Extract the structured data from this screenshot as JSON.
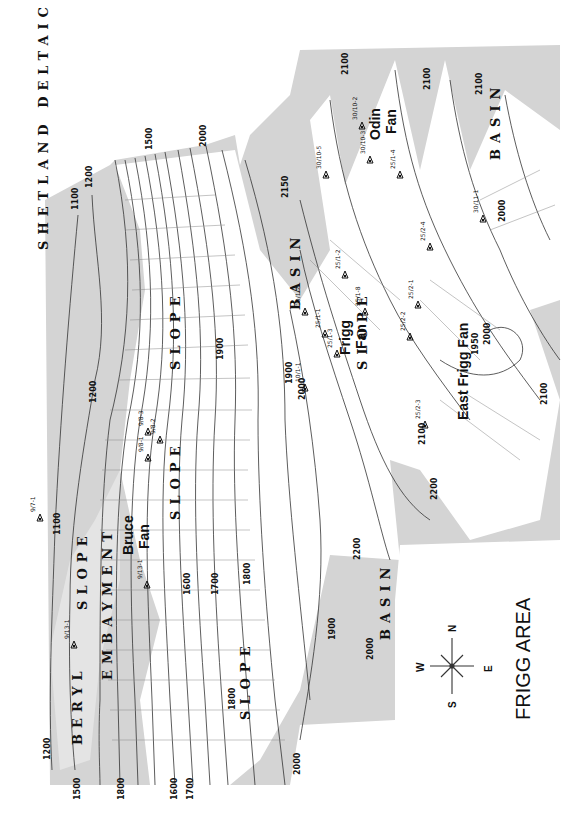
{
  "title": "FRIGG AREA",
  "compass": {
    "n": "N",
    "s": "S",
    "e": "E",
    "w": "W"
  },
  "colors": {
    "basin_shade": "#cfcfcf",
    "platform_shade": "#d6d6d6",
    "slope_white": "#ffffff",
    "contour": "#333333"
  },
  "regions": [
    {
      "id": "shetland",
      "label": "SHETLAND DELTAIC PLATFORM",
      "x": 48,
      "y": 250,
      "rotate": -90
    },
    {
      "id": "beryl",
      "label": "BERYL",
      "x": 82,
      "y": 745,
      "rotate": -90
    },
    {
      "id": "embayment",
      "label": "EMBAYMENT",
      "x": 112,
      "y": 680,
      "rotate": -90
    },
    {
      "id": "slope1",
      "label": "SLOPE",
      "x": 87,
      "y": 610,
      "rotate": -90
    },
    {
      "id": "slope2",
      "label": "SLOPE",
      "x": 180,
      "y": 370,
      "rotate": -90
    },
    {
      "id": "slope3",
      "label": "SLOPE",
      "x": 180,
      "y": 520,
      "rotate": -90
    },
    {
      "id": "slope4",
      "label": "SLOPE",
      "x": 250,
      "y": 720,
      "rotate": -90
    },
    {
      "id": "slope5",
      "label": "SLOPE",
      "x": 367,
      "y": 370,
      "rotate": -90
    },
    {
      "id": "basin1",
      "label": "BASIN",
      "x": 300,
      "y": 310,
      "rotate": -90
    },
    {
      "id": "basin2",
      "label": "BASIN",
      "x": 390,
      "y": 640,
      "rotate": -90
    },
    {
      "id": "basin3",
      "label": "BASIN",
      "x": 500,
      "y": 160,
      "rotate": -90
    }
  ],
  "fans": [
    {
      "id": "bruce",
      "label1": "Bruce",
      "label2": "Fan",
      "x": 133,
      "y": 555
    },
    {
      "id": "frigg",
      "label1": "Frigg",
      "label2": "Fan",
      "x": 350,
      "y": 355
    },
    {
      "id": "odin",
      "label1": "Odin",
      "label2": "Fan",
      "x": 380,
      "y": 140
    },
    {
      "id": "east_frigg",
      "label1": "East Frigg Fan",
      "label2": "",
      "x": 468,
      "y": 420
    }
  ],
  "contour_labels": [
    {
      "text": "1500",
      "x": 152,
      "y": 150
    },
    {
      "text": "2000",
      "x": 206,
      "y": 147
    },
    {
      "text": "1100",
      "x": 78,
      "y": 210
    },
    {
      "text": "1200",
      "x": 92,
      "y": 188
    },
    {
      "text": "2150",
      "x": 288,
      "y": 198
    },
    {
      "text": "2100",
      "x": 348,
      "y": 75
    },
    {
      "text": "2100",
      "x": 430,
      "y": 90
    },
    {
      "text": "2100",
      "x": 482,
      "y": 95
    },
    {
      "text": "2000",
      "x": 505,
      "y": 222
    },
    {
      "text": "1200",
      "x": 96,
      "y": 403
    },
    {
      "text": "1900",
      "x": 223,
      "y": 360
    },
    {
      "text": "1100",
      "x": 60,
      "y": 535
    },
    {
      "text": "1600",
      "x": 190,
      "y": 595
    },
    {
      "text": "1700",
      "x": 218,
      "y": 595
    },
    {
      "text": "1800",
      "x": 250,
      "y": 585
    },
    {
      "text": "1800",
      "x": 235,
      "y": 710
    },
    {
      "text": "1900",
      "x": 292,
      "y": 384
    },
    {
      "text": "2000",
      "x": 305,
      "y": 400
    },
    {
      "text": "1950",
      "x": 478,
      "y": 355
    },
    {
      "text": "2000",
      "x": 490,
      "y": 345
    },
    {
      "text": "2100",
      "x": 547,
      "y": 405
    },
    {
      "text": "2100",
      "x": 425,
      "y": 445
    },
    {
      "text": "2200",
      "x": 437,
      "y": 500
    },
    {
      "text": "2200",
      "x": 360,
      "y": 560
    },
    {
      "text": "1900",
      "x": 335,
      "y": 640
    },
    {
      "text": "2000",
      "x": 373,
      "y": 660
    },
    {
      "text": "2000",
      "x": 300,
      "y": 775
    },
    {
      "text": "1200",
      "x": 50,
      "y": 760
    },
    {
      "text": "1500",
      "x": 80,
      "y": 800
    },
    {
      "text": "1800",
      "x": 124,
      "y": 800
    },
    {
      "text": "1600",
      "x": 177,
      "y": 800
    },
    {
      "text": "1700",
      "x": 193,
      "y": 800
    }
  ],
  "wells": [
    {
      "id": "9/7-1",
      "x": 40,
      "y": 518
    },
    {
      "id": "9/8-3",
      "x": 148,
      "y": 432
    },
    {
      "id": "9/8-2",
      "x": 160,
      "y": 440
    },
    {
      "id": "9/8-1",
      "x": 148,
      "y": 458
    },
    {
      "id": "9/13-1",
      "x": 147,
      "y": 585
    },
    {
      "id": "9/13-1b",
      "label": "9/13-1",
      "x": 74,
      "y": 645
    },
    {
      "id": "10/1-1",
      "x": 305,
      "y": 388
    },
    {
      "id": "10/1-2",
      "x": 305,
      "y": 312
    },
    {
      "id": "25/1-1",
      "x": 325,
      "y": 334
    },
    {
      "id": "25/1-3",
      "x": 337,
      "y": 354
    },
    {
      "id": "25/1-2",
      "x": 345,
      "y": 275
    },
    {
      "id": "25/1-8",
      "x": 365,
      "y": 312
    },
    {
      "id": "25/2-2",
      "x": 410,
      "y": 337
    },
    {
      "id": "25/2-1",
      "x": 418,
      "y": 305
    },
    {
      "id": "25/2-3",
      "x": 425,
      "y": 425
    },
    {
      "id": "25/2-4",
      "x": 430,
      "y": 247
    },
    {
      "id": "25/1-4",
      "x": 400,
      "y": 175
    },
    {
      "id": "30/10-3",
      "x": 370,
      "y": 160
    },
    {
      "id": "30/10-2",
      "x": 362,
      "y": 126
    },
    {
      "id": "30/10-5",
      "x": 326,
      "y": 175
    },
    {
      "id": "30/11-1",
      "x": 483,
      "y": 219
    }
  ]
}
